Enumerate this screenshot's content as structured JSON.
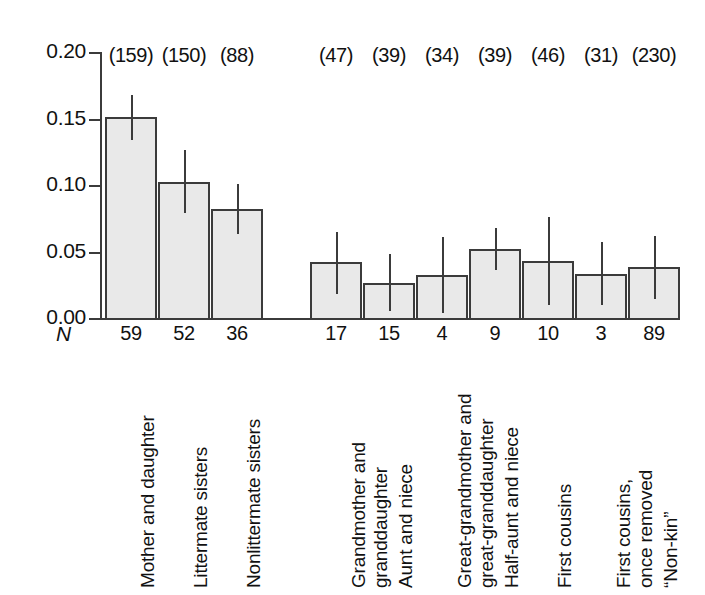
{
  "chart_data": {
    "type": "bar",
    "title": "",
    "subtitle": "",
    "xlabel": "",
    "ylabel": "",
    "ylim": [
      0.0,
      0.2
    ],
    "ytick_labels": [
      "0.00",
      "0.05",
      "0.10",
      "0.15",
      "0.20"
    ],
    "ytick_values": [
      0.0,
      0.05,
      0.1,
      0.15,
      0.2
    ],
    "grid": false,
    "legend": "none",
    "n_row_label": "N",
    "groups": [
      {
        "name": "close-kin",
        "categories": [
          {
            "label_lines": [
              "Mother and daughter"
            ],
            "value": 0.151,
            "err_low": 0.134,
            "err_high": 0.168,
            "n_pairs": 59,
            "n_observations": 159,
            "n_observations_label": "(159)"
          },
          {
            "label_lines": [
              "Littermate sisters"
            ],
            "value": 0.102,
            "err_low": 0.079,
            "err_high": 0.126,
            "n_pairs": 52,
            "n_observations": 150,
            "n_observations_label": "(150)"
          },
          {
            "label_lines": [
              "Nonlittermate sisters"
            ],
            "value": 0.082,
            "err_low": 0.063,
            "err_high": 0.101,
            "n_pairs": 36,
            "n_observations": 88,
            "n_observations_label": "(88)"
          }
        ]
      },
      {
        "name": "distant-kin-and-nonkin",
        "categories": [
          {
            "label_lines": [
              "Grandmother and",
              "granddaughter"
            ],
            "value": 0.042,
            "err_low": 0.018,
            "err_high": 0.065,
            "n_pairs": 17,
            "n_observations": 47,
            "n_observations_label": "(47)"
          },
          {
            "label_lines": [
              "Aunt and niece"
            ],
            "value": 0.026,
            "err_low": 0.005,
            "err_high": 0.048,
            "n_pairs": 15,
            "n_observations": 39,
            "n_observations_label": "(39)"
          },
          {
            "label_lines": [
              "Great-grandmother and",
              "great-granddaughter"
            ],
            "value": 0.032,
            "err_low": 0.004,
            "err_high": 0.061,
            "n_pairs": 4,
            "n_observations": 34,
            "n_observations_label": "(34)"
          },
          {
            "label_lines": [
              "Half-aunt and niece"
            ],
            "value": 0.052,
            "err_low": 0.036,
            "err_high": 0.068,
            "n_pairs": 9,
            "n_observations": 39,
            "n_observations_label": "(39)"
          },
          {
            "label_lines": [
              "First cousins"
            ],
            "value": 0.043,
            "err_low": 0.01,
            "err_high": 0.076,
            "n_pairs": 10,
            "n_observations": 46,
            "n_observations_label": "(46)"
          },
          {
            "label_lines": [
              "First cousins,",
              "once removed"
            ],
            "value": 0.033,
            "err_low": 0.01,
            "err_high": 0.057,
            "n_pairs": 3,
            "n_observations": 31,
            "n_observations_label": "(31)"
          },
          {
            "label_lines": [
              "“Non-kin”"
            ],
            "value": 0.038,
            "err_low": 0.014,
            "err_high": 0.062,
            "n_pairs": 89,
            "n_observations": 230,
            "n_observations_label": "(230)"
          }
        ]
      }
    ],
    "colors": {
      "bar_fill": "#e9e9e9",
      "bar_stroke": "#3b3b3b",
      "axis": "#3b3b3b",
      "text": "#111111",
      "background": "#ffffff"
    }
  }
}
